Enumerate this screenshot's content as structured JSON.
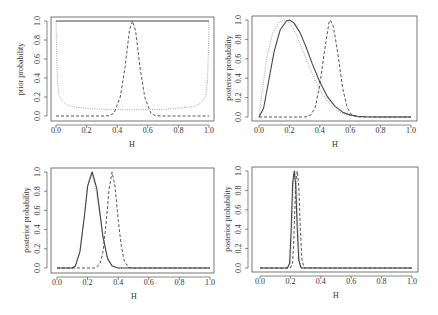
{
  "figure": {
    "panels": [
      {
        "id": "top-left",
        "ylabel": "prior probability",
        "xlabel": "H"
      },
      {
        "id": "top-right",
        "ylabel": "posterior probability",
        "xlabel": "H"
      },
      {
        "id": "bottom-left",
        "ylabel": "posterior probability",
        "xlabel": "H"
      },
      {
        "id": "bottom-right",
        "ylabel": "posterior probability",
        "xlabel": "H"
      }
    ],
    "xticks": [
      "0.0",
      "0.2",
      "0.4",
      "0.6",
      "0.8",
      "1.0"
    ],
    "yticks": [
      "0.0",
      "0.2",
      "0.4",
      "0.6",
      "0.8",
      "1.0"
    ],
    "line_color": "#444444",
    "dotted_color": "#9a9a9a"
  },
  "chart_data": [
    {
      "type": "line",
      "title": "",
      "xlabel": "H",
      "ylabel": "prior probability",
      "xlim": [
        0,
        1
      ],
      "ylim": [
        0,
        1
      ],
      "grid": false,
      "series": [
        {
          "name": "uniform prior",
          "style": "solid",
          "x": [
            0.0,
            0.25,
            0.5,
            0.75,
            1.0
          ],
          "y": [
            1.0,
            1.0,
            1.0,
            1.0,
            1.0
          ]
        },
        {
          "name": "peaked prior",
          "style": "dashed",
          "x": [
            0.0,
            0.3,
            0.35,
            0.38,
            0.42,
            0.45,
            0.48,
            0.5,
            0.52,
            0.55,
            0.58,
            0.62,
            0.65,
            0.7,
            1.0
          ],
          "y": [
            0.0,
            0.0,
            0.003,
            0.03,
            0.2,
            0.5,
            0.9,
            1.0,
            0.9,
            0.5,
            0.2,
            0.03,
            0.003,
            0.0,
            0.0
          ]
        },
        {
          "name": "U-shaped prior",
          "style": "dotted",
          "x": [
            0.0,
            0.005,
            0.01,
            0.02,
            0.04,
            0.07,
            0.1,
            0.2,
            0.3,
            0.5,
            0.7,
            0.8,
            0.9,
            0.93,
            0.96,
            0.98,
            0.99,
            0.995,
            1.0
          ],
          "y": [
            1.0,
            0.62,
            0.36,
            0.22,
            0.16,
            0.12,
            0.1,
            0.08,
            0.07,
            0.065,
            0.07,
            0.08,
            0.1,
            0.12,
            0.16,
            0.22,
            0.36,
            0.62,
            1.0
          ]
        }
      ]
    },
    {
      "type": "line",
      "title": "",
      "xlabel": "H",
      "ylabel": "posterior probability",
      "xlim": [
        0,
        1
      ],
      "ylim": [
        0,
        1
      ],
      "grid": false,
      "series": [
        {
          "name": "posterior (uniform prior)",
          "style": "solid",
          "x": [
            0.0,
            0.03,
            0.06,
            0.1,
            0.14,
            0.18,
            0.2,
            0.23,
            0.27,
            0.31,
            0.35,
            0.4,
            0.45,
            0.5,
            0.55,
            0.6,
            0.65,
            0.7,
            0.8,
            1.0
          ],
          "y": [
            0.0,
            0.09,
            0.34,
            0.68,
            0.9,
            0.99,
            1.0,
            0.97,
            0.87,
            0.72,
            0.55,
            0.36,
            0.21,
            0.11,
            0.05,
            0.022,
            0.008,
            0.003,
            0.0,
            0.0
          ]
        },
        {
          "name": "posterior (peaked prior)",
          "style": "dashed",
          "x": [
            0.0,
            0.3,
            0.34,
            0.37,
            0.4,
            0.43,
            0.46,
            0.47,
            0.49,
            0.52,
            0.55,
            0.58,
            0.61,
            0.65,
            1.0
          ],
          "y": [
            0.0,
            0.0,
            0.02,
            0.1,
            0.33,
            0.67,
            0.97,
            1.0,
            0.93,
            0.64,
            0.3,
            0.1,
            0.02,
            0.0,
            0.0
          ]
        },
        {
          "name": "posterior (U-shaped prior)",
          "style": "dotted",
          "x": [
            0.0,
            0.02,
            0.05,
            0.09,
            0.13,
            0.17,
            0.2,
            0.24,
            0.28,
            0.32,
            0.36,
            0.4,
            0.45,
            0.5,
            0.55,
            0.6,
            0.65,
            0.7,
            0.8,
            1.0
          ],
          "y": [
            0.0,
            0.25,
            0.6,
            0.87,
            0.98,
            1.0,
            0.97,
            0.87,
            0.72,
            0.56,
            0.41,
            0.28,
            0.16,
            0.08,
            0.035,
            0.014,
            0.005,
            0.002,
            0.0,
            0.0
          ]
        }
      ]
    },
    {
      "type": "line",
      "title": "",
      "xlabel": "H",
      "ylabel": "posterior probability",
      "xlim": [
        0,
        1
      ],
      "ylim": [
        0,
        1
      ],
      "grid": false,
      "series": [
        {
          "name": "posterior (uniform prior)",
          "style": "solid",
          "x": [
            0.0,
            0.1,
            0.12,
            0.15,
            0.18,
            0.2,
            0.23,
            0.26,
            0.28,
            0.3,
            0.33,
            0.36,
            0.4,
            1.0
          ],
          "y": [
            0.0,
            0.0,
            0.02,
            0.17,
            0.55,
            0.85,
            1.0,
            0.83,
            0.58,
            0.33,
            0.1,
            0.02,
            0.0,
            0.0
          ]
        },
        {
          "name": "posterior (peaked prior)",
          "style": "dashed",
          "x": [
            0.0,
            0.25,
            0.28,
            0.3,
            0.32,
            0.34,
            0.36,
            0.38,
            0.4,
            0.42,
            0.44,
            0.47,
            0.5,
            1.0
          ],
          "y": [
            0.0,
            0.0,
            0.04,
            0.16,
            0.45,
            0.82,
            1.0,
            0.84,
            0.5,
            0.23,
            0.07,
            0.005,
            0.0,
            0.0
          ]
        },
        {
          "name": "posterior (U-shaped prior)",
          "style": "dotted",
          "x": [
            0.0,
            0.1,
            0.12,
            0.15,
            0.18,
            0.2,
            0.225,
            0.25,
            0.28,
            0.3,
            0.33,
            0.36,
            0.4,
            1.0
          ],
          "y": [
            0.0,
            0.0,
            0.02,
            0.18,
            0.57,
            0.87,
            1.0,
            0.85,
            0.56,
            0.32,
            0.1,
            0.02,
            0.0,
            0.0
          ]
        }
      ]
    },
    {
      "type": "line",
      "title": "",
      "xlabel": "H",
      "ylabel": "posterior probability",
      "xlim": [
        0,
        1
      ],
      "ylim": [
        0,
        1
      ],
      "grid": false,
      "series": [
        {
          "name": "posterior (uniform prior)",
          "style": "solid",
          "x": [
            0.0,
            0.18,
            0.195,
            0.205,
            0.215,
            0.225,
            0.235,
            0.245,
            0.255,
            0.27,
            1.0
          ],
          "y": [
            0.0,
            0.0,
            0.05,
            0.4,
            0.88,
            1.0,
            0.85,
            0.4,
            0.08,
            0.0,
            0.0
          ]
        },
        {
          "name": "posterior (peaked prior)",
          "style": "dashed",
          "x": [
            0.0,
            0.2,
            0.215,
            0.225,
            0.235,
            0.245,
            0.255,
            0.265,
            0.275,
            0.29,
            1.0
          ],
          "y": [
            0.0,
            0.0,
            0.05,
            0.4,
            0.88,
            1.0,
            0.85,
            0.42,
            0.1,
            0.0,
            0.0
          ]
        },
        {
          "name": "posterior (U-shaped prior)",
          "style": "dotted",
          "x": [
            0.0,
            0.185,
            0.2,
            0.21,
            0.22,
            0.23,
            0.24,
            0.25,
            0.26,
            0.275,
            1.0
          ],
          "y": [
            0.0,
            0.0,
            0.05,
            0.4,
            0.88,
            1.0,
            0.85,
            0.4,
            0.08,
            0.0,
            0.0
          ]
        }
      ]
    }
  ]
}
